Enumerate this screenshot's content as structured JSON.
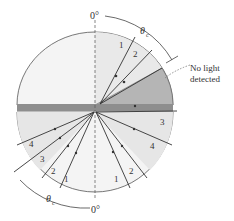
{
  "labels": {
    "top_zero": "0°",
    "bottom_zero": "0°",
    "theta_top": "θ",
    "theta_top_sub": "c",
    "theta_bottom": "θ",
    "theta_bottom_sub": "c",
    "no_light_line1": "No light",
    "no_light_line2": "detected"
  },
  "rays_top": [
    {
      "label": "1"
    },
    {
      "label": "2"
    }
  ],
  "rays_bottom_left": [
    {
      "label": "1"
    },
    {
      "label": "2"
    },
    {
      "label": "3"
    },
    {
      "label": "4"
    }
  ],
  "rays_bottom_right": [
    {
      "label": "1"
    },
    {
      "label": "2"
    },
    {
      "label": "3"
    },
    {
      "label": "4"
    }
  ],
  "colors": {
    "semicircle_fill": "#f2f2f2",
    "lit_wedge_fill": "#e6e6e6",
    "dark_region_fill": "#b3b3b3",
    "bar_fill": "#8c8c8c",
    "line": "#333333"
  }
}
